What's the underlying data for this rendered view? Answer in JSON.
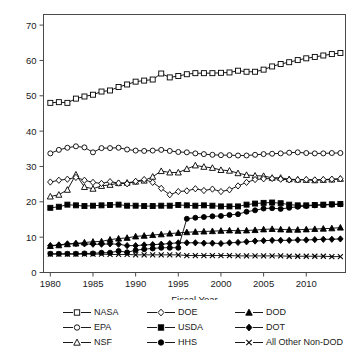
{
  "chart_data": {
    "type": "line",
    "title": "",
    "xlabel": "Fiscal Year",
    "ylabel": "",
    "xlim": [
      1979.2,
      2014.6
    ],
    "ylim": [
      0,
      73
    ],
    "grid": false,
    "legend_position": "below",
    "xticks": [
      1980,
      1985,
      1990,
      1995,
      2000,
      2005,
      2010
    ],
    "xtick_labels": [
      "1980",
      "1985",
      "1990",
      "1995",
      "2000",
      "2005",
      "2010"
    ],
    "yticks": [
      0,
      10,
      20,
      30,
      40,
      50,
      60,
      70
    ],
    "ytick_labels": [
      "0",
      "10",
      "20",
      "30",
      "40",
      "50",
      "60",
      "70"
    ],
    "x": [
      1980,
      1981,
      1982,
      1983,
      1984,
      1985,
      1986,
      1987,
      1988,
      1989,
      1990,
      1991,
      1992,
      1993,
      1994,
      1995,
      1996,
      1997,
      1998,
      1999,
      2000,
      2001,
      2002,
      2003,
      2004,
      2005,
      2006,
      2007,
      2008,
      2009,
      2010,
      2011,
      2012,
      2013,
      2014
    ],
    "series": [
      {
        "name": "NASA",
        "marker": "open-square",
        "values": [
          48.0,
          48.2,
          48.0,
          49.2,
          49.8,
          50.3,
          51.2,
          51.5,
          52.5,
          53.2,
          54.0,
          54.3,
          54.6,
          56.3,
          55.2,
          55.6,
          56.1,
          56.4,
          56.4,
          56.4,
          56.5,
          56.6,
          57.1,
          56.8,
          56.8,
          57.4,
          58.3,
          59.0,
          59.5,
          60.1,
          60.6,
          61.0,
          61.4,
          61.8,
          62.1
        ]
      },
      {
        "name": "EPA",
        "marker": "open-circle",
        "values": [
          33.7,
          34.7,
          35.3,
          35.7,
          35.4,
          34.0,
          35.2,
          35.2,
          35.3,
          34.8,
          34.5,
          34.4,
          34.5,
          34.7,
          34.4,
          34.1,
          34.0,
          33.7,
          33.5,
          33.3,
          33.2,
          33.2,
          33.1,
          33.1,
          33.3,
          33.5,
          33.6,
          33.7,
          33.9,
          34.0,
          33.8,
          33.7,
          33.7,
          33.8,
          33.8
        ]
      },
      {
        "name": "NSF",
        "marker": "open-triangle",
        "values": [
          21.5,
          22.0,
          23.4,
          27.7,
          24.2,
          23.7,
          24.5,
          24.8,
          25.3,
          25.4,
          25.7,
          26.0,
          27.1,
          28.7,
          28.3,
          28.3,
          29.3,
          30.3,
          29.9,
          29.6,
          29.0,
          28.8,
          28.1,
          27.6,
          27.4,
          27.3,
          26.8,
          26.8,
          26.4,
          26.3,
          26.2,
          26.1,
          26.2,
          26.3,
          26.5
        ]
      },
      {
        "name": "DOE",
        "marker": "open-diamond",
        "values": [
          25.6,
          26.1,
          26.4,
          26.9,
          26.1,
          25.5,
          25.2,
          25.7,
          25.3,
          25.1,
          25.8,
          26.3,
          25.5,
          23.8,
          22.0,
          22.9,
          23.1,
          23.7,
          23.2,
          23.6,
          22.9,
          23.4,
          24.5,
          25.5,
          26.3,
          26.5,
          26.6,
          26.4,
          26.2,
          26.2,
          26.3,
          26.2,
          26.3,
          26.4,
          26.5
        ]
      },
      {
        "name": "USDA",
        "marker": "filled-square",
        "values": [
          18.3,
          18.6,
          19.2,
          19.0,
          18.8,
          18.9,
          19.0,
          19.1,
          19.2,
          18.9,
          18.9,
          18.8,
          18.8,
          18.9,
          18.9,
          19.1,
          19.0,
          18.9,
          19.0,
          18.9,
          18.7,
          18.7,
          18.7,
          19.2,
          19.5,
          19.7,
          19.8,
          19.6,
          19.2,
          19.0,
          19.0,
          19.1,
          19.2,
          19.3,
          19.4
        ]
      },
      {
        "name": "HHS",
        "marker": "filled-circle",
        "values": [
          5.3,
          5.3,
          5.3,
          5.3,
          5.4,
          5.4,
          5.6,
          5.6,
          6.1,
          5.7,
          6.3,
          6.6,
          6.8,
          7.0,
          7.0,
          7.0,
          15.2,
          15.5,
          15.7,
          15.9,
          16.0,
          16.3,
          16.5,
          17.2,
          17.6,
          18.1,
          18.2,
          18.0,
          18.3,
          18.6,
          18.8,
          19.0,
          19.1,
          19.2,
          19.3
        ]
      },
      {
        "name": "DOD",
        "marker": "filled-triangle",
        "values": [
          7.5,
          7.7,
          8.0,
          8.2,
          8.5,
          8.7,
          8.8,
          9.3,
          9.6,
          9.8,
          10.2,
          10.4,
          10.6,
          10.8,
          11.0,
          11.2,
          11.4,
          11.5,
          11.6,
          11.7,
          11.8,
          11.9,
          11.8,
          11.9,
          12.0,
          12.2,
          12.3,
          12.2,
          12.1,
          12.1,
          12.2,
          12.3,
          12.4,
          12.5,
          12.7
        ]
      },
      {
        "name": "DOT",
        "marker": "filled-diamond",
        "values": [
          7.6,
          7.8,
          8.1,
          8.2,
          8.1,
          8.0,
          8.0,
          8.1,
          8.0,
          7.6,
          7.6,
          7.8,
          7.9,
          8.0,
          8.2,
          8.4,
          8.4,
          8.4,
          8.3,
          8.3,
          8.2,
          8.4,
          8.5,
          8.7,
          8.9,
          9.0,
          9.1,
          9.1,
          9.1,
          9.2,
          9.2,
          9.3,
          9.4,
          9.4,
          9.5
        ]
      },
      {
        "name": "All Other Non-DOD",
        "marker": "cross-x",
        "values": [
          5.2,
          5.2,
          5.2,
          5.2,
          5.2,
          5.2,
          5.2,
          5.1,
          5.1,
          5.1,
          5.0,
          5.0,
          5.0,
          5.0,
          5.0,
          5.0,
          4.8,
          4.8,
          4.8,
          4.8,
          4.8,
          4.8,
          4.7,
          4.7,
          4.7,
          4.7,
          4.7,
          4.7,
          4.6,
          4.6,
          4.6,
          4.6,
          4.6,
          4.5,
          4.5
        ]
      }
    ]
  },
  "legend": {
    "rows": [
      [
        {
          "label": "NASA",
          "marker": "open-square"
        },
        {
          "label": "DOE",
          "marker": "open-diamond"
        },
        {
          "label": "DOD",
          "marker": "filled-triangle"
        }
      ],
      [
        {
          "label": "EPA",
          "marker": "open-circle"
        },
        {
          "label": "USDA",
          "marker": "filled-square"
        },
        {
          "label": "DOT",
          "marker": "filled-diamond"
        }
      ],
      [
        {
          "label": "NSF",
          "marker": "open-triangle"
        },
        {
          "label": "HHS",
          "marker": "filled-circle"
        },
        {
          "label": "All Other Non-DOD",
          "marker": "cross-x"
        }
      ]
    ]
  },
  "colors": {
    "line": "#000000",
    "axis": "#4a4a4a",
    "text": "#1a1a1a",
    "background": "#ffffff"
  }
}
